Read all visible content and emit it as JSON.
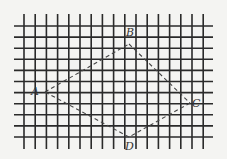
{
  "figure": {
    "type": "grid-quadrilateral",
    "grid": {
      "columns": 16,
      "rows": 10,
      "color": "#2a2a2a"
    },
    "background": "#f4f4f2",
    "line_style": "dashed",
    "vertices": [
      {
        "id": "A",
        "label": "A"
      },
      {
        "id": "B",
        "label": "B"
      },
      {
        "id": "C",
        "label": "C"
      },
      {
        "id": "D",
        "label": "D"
      }
    ],
    "edges": [
      {
        "from": "A",
        "to": "B"
      },
      {
        "from": "B",
        "to": "C"
      },
      {
        "from": "C",
        "to": "D"
      },
      {
        "from": "D",
        "to": "A"
      }
    ]
  }
}
